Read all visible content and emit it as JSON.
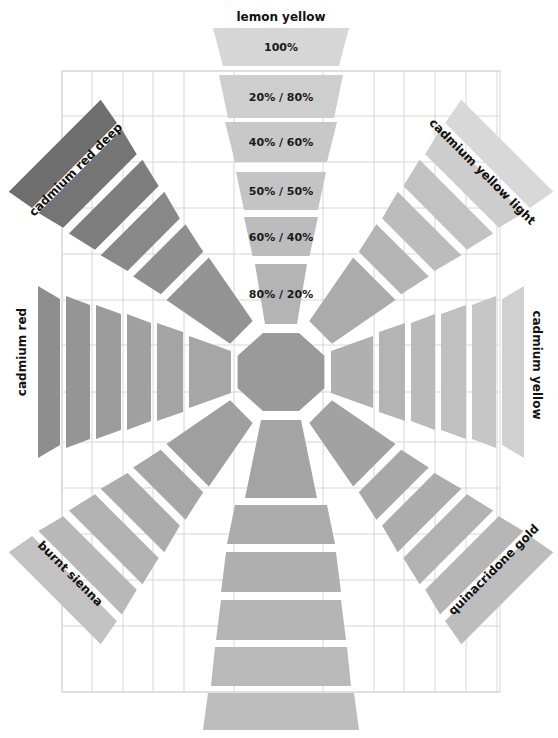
{
  "center": {
    "x": 281,
    "y": 372,
    "pigment": "lemon yellow",
    "color": "#9a9a9a"
  },
  "grid": {
    "x0": 62,
    "y0": 71,
    "x1": 500,
    "y1": 692,
    "cols": [
      62,
      92,
      123,
      153,
      184,
      234,
      323,
      374,
      404,
      435,
      466,
      497
    ],
    "rows": [
      71,
      116,
      162,
      208,
      254,
      300,
      345,
      392,
      442,
      488,
      534,
      580,
      626,
      692
    ],
    "line_color": "#d6d6d6"
  },
  "mix_ratios": [
    "100%",
    "20% / 80%",
    "40% / 60%",
    "50% / 50%",
    "60% / 40%",
    "80% / 20%"
  ],
  "arms": [
    {
      "name": "lemon yellow",
      "direction": "top",
      "angle": 0,
      "show_ratios": true,
      "label": {
        "text": "lemon yellow",
        "x": 281,
        "y": 17,
        "rot": 0,
        "size": 12
      },
      "bands": [
        {
          "r0": 306,
          "r1": 344,
          "w0": 116,
          "w1": 136,
          "color": "#d6d6d6"
        },
        {
          "r0": 254,
          "r1": 297,
          "w0": 106,
          "w1": 124,
          "color": "#cecece"
        },
        {
          "r0": 210,
          "r1": 250,
          "w0": 92,
          "w1": 112,
          "color": "#c8c8c8"
        },
        {
          "r0": 162,
          "r1": 200,
          "w0": 74,
          "w1": 90,
          "color": "#c4c4c4"
        },
        {
          "r0": 116,
          "r1": 155,
          "w0": 57,
          "w1": 74,
          "color": "#bcbcbc"
        },
        {
          "r0": 48,
          "r1": 108,
          "w0": 32,
          "w1": 52,
          "color": "#b4b4b4"
        }
      ]
    },
    {
      "name": "cadmium yellow light",
      "direction": "top-right",
      "angle": 45,
      "label": {
        "text": "cadmium yellow light",
        "x": 482,
        "y": 172,
        "rot": 45,
        "size": 12
      },
      "bands": [
        {
          "r0": 292,
          "r1": 320,
          "w0": 120,
          "w1": 130,
          "color": "#d8d8d8"
        },
        {
          "r0": 256,
          "r1": 284,
          "w0": 104,
          "w1": 118,
          "color": "#cdcdcd"
        },
        {
          "r0": 218,
          "r1": 248,
          "w0": 90,
          "w1": 104,
          "color": "#c2c2c2"
        },
        {
          "r0": 180,
          "r1": 210,
          "w0": 74,
          "w1": 90,
          "color": "#bcbcbc"
        },
        {
          "r0": 140,
          "r1": 172,
          "w0": 60,
          "w1": 74,
          "color": "#b4b4b4"
        },
        {
          "r0": 56,
          "r1": 132,
          "w0": 32,
          "w1": 60,
          "color": "#ababab"
        }
      ]
    },
    {
      "name": "cadmium yellow",
      "direction": "right",
      "angle": 90,
      "label": {
        "text": "cadmium yellow",
        "x": 536,
        "y": 365,
        "rot": 90,
        "size": 12
      },
      "bands": [
        {
          "r0": 221,
          "r1": 243,
          "w0": 146,
          "w1": 172,
          "color": "#d0d0d0"
        },
        {
          "r0": 191,
          "r1": 215,
          "w0": 134,
          "w1": 152,
          "color": "#c6c6c6"
        },
        {
          "r0": 160,
          "r1": 185,
          "w0": 116,
          "w1": 134,
          "color": "#c0c0c0"
        },
        {
          "r0": 130,
          "r1": 154,
          "w0": 98,
          "w1": 116,
          "color": "#bababa"
        },
        {
          "r0": 98,
          "r1": 124,
          "w0": 80,
          "w1": 98,
          "color": "#b4b4b4"
        },
        {
          "r0": 50,
          "r1": 92,
          "w0": 42,
          "w1": 72,
          "color": "#b0b0b0"
        }
      ]
    },
    {
      "name": "quinacridone gold",
      "direction": "bottom-right",
      "angle": 135,
      "label": {
        "text": "quinacridone gold",
        "x": 494,
        "y": 570,
        "rot": -45,
        "size": 12
      },
      "bands": [
        {
          "r0": 292,
          "r1": 320,
          "w0": 120,
          "w1": 130,
          "color": "#bdbdbd"
        },
        {
          "r0": 256,
          "r1": 284,
          "w0": 104,
          "w1": 118,
          "color": "#b6b6b6"
        },
        {
          "r0": 218,
          "r1": 248,
          "w0": 90,
          "w1": 104,
          "color": "#b2b2b2"
        },
        {
          "r0": 180,
          "r1": 210,
          "w0": 74,
          "w1": 90,
          "color": "#acacac"
        },
        {
          "r0": 140,
          "r1": 172,
          "w0": 60,
          "w1": 74,
          "color": "#a8a8a8"
        },
        {
          "r0": 56,
          "r1": 132,
          "w0": 32,
          "w1": 60,
          "color": "#a2a2a2"
        }
      ]
    },
    {
      "name": "bottom (unlabeled)",
      "direction": "bottom",
      "angle": 180,
      "label": null,
      "bands": [
        {
          "r0": 321,
          "r1": 358,
          "w0": 146,
          "w1": 156,
          "color": "#bdbdbd"
        },
        {
          "r0": 275,
          "r1": 314,
          "w0": 132,
          "w1": 140,
          "color": "#b9b9b9"
        },
        {
          "r0": 228,
          "r1": 268,
          "w0": 120,
          "w1": 130,
          "color": "#b4b4b4"
        },
        {
          "r0": 180,
          "r1": 220,
          "w0": 110,
          "w1": 120,
          "color": "#b0b0b0"
        },
        {
          "r0": 133,
          "r1": 172,
          "w0": 92,
          "w1": 108,
          "color": "#ababab"
        },
        {
          "r0": 48,
          "r1": 126,
          "w0": 40,
          "w1": 72,
          "color": "#a4a4a4"
        }
      ]
    },
    {
      "name": "burnt sienna",
      "direction": "bottom-left",
      "angle": 225,
      "label": {
        "text": "burnt sienna",
        "x": 70,
        "y": 574,
        "rot": 45,
        "size": 12
      },
      "bands": [
        {
          "r0": 292,
          "r1": 320,
          "w0": 120,
          "w1": 130,
          "color": "#c2c2c2"
        },
        {
          "r0": 256,
          "r1": 284,
          "w0": 104,
          "w1": 118,
          "color": "#b8b8b8"
        },
        {
          "r0": 218,
          "r1": 248,
          "w0": 90,
          "w1": 104,
          "color": "#b2b2b2"
        },
        {
          "r0": 180,
          "r1": 210,
          "w0": 74,
          "w1": 90,
          "color": "#acacac"
        },
        {
          "r0": 140,
          "r1": 172,
          "w0": 60,
          "w1": 74,
          "color": "#a6a6a6"
        },
        {
          "r0": 56,
          "r1": 132,
          "w0": 32,
          "w1": 60,
          "color": "#9f9f9f"
        }
      ]
    },
    {
      "name": "cadmium red",
      "direction": "left",
      "angle": 270,
      "label": {
        "text": "cadmium red",
        "x": 22,
        "y": 352,
        "rot": -90,
        "size": 12
      },
      "bands": [
        {
          "r0": 221,
          "r1": 243,
          "w0": 146,
          "w1": 172,
          "color": "#8e8e8e"
        },
        {
          "r0": 191,
          "r1": 215,
          "w0": 134,
          "w1": 152,
          "color": "#959595"
        },
        {
          "r0": 160,
          "r1": 185,
          "w0": 116,
          "w1": 134,
          "color": "#9c9c9c"
        },
        {
          "r0": 130,
          "r1": 154,
          "w0": 98,
          "w1": 116,
          "color": "#a0a0a0"
        },
        {
          "r0": 98,
          "r1": 124,
          "w0": 80,
          "w1": 98,
          "color": "#a4a4a4"
        },
        {
          "r0": 50,
          "r1": 92,
          "w0": 42,
          "w1": 72,
          "color": "#a6a6a6"
        }
      ]
    },
    {
      "name": "cadmium red deep",
      "direction": "top-left",
      "angle": 315,
      "label": {
        "text": "cadmium red deep",
        "x": 76,
        "y": 170,
        "rot": -45,
        "size": 12
      },
      "bands": [
        {
          "r0": 292,
          "r1": 320,
          "w0": 120,
          "w1": 130,
          "color": "#6e6e6e"
        },
        {
          "r0": 256,
          "r1": 284,
          "w0": 104,
          "w1": 118,
          "color": "#757575"
        },
        {
          "r0": 218,
          "r1": 248,
          "w0": 90,
          "w1": 104,
          "color": "#7e7e7e"
        },
        {
          "r0": 180,
          "r1": 210,
          "w0": 74,
          "w1": 90,
          "color": "#888888"
        },
        {
          "r0": 140,
          "r1": 172,
          "w0": 60,
          "w1": 74,
          "color": "#8e8e8e"
        },
        {
          "r0": 56,
          "r1": 132,
          "w0": 32,
          "w1": 60,
          "color": "#939393"
        }
      ]
    }
  ]
}
